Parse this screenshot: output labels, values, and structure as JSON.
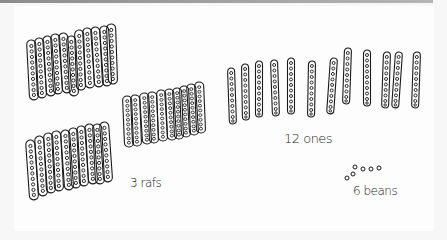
{
  "drawing": {
    "description": "Hand-drawn bean-stick place value representation",
    "ink_color": "#1a1a1a",
    "groups": [
      {
        "name": "rafts",
        "count": 3,
        "label": "3 rafs"
      },
      {
        "name": "ones",
        "count": 12,
        "label": "12 ones"
      },
      {
        "name": "beans",
        "count": 6,
        "label": "6 beans"
      }
    ]
  },
  "labels": {
    "rafts": "3 rafs",
    "ones": "12 ones",
    "beans": "6 beans"
  }
}
